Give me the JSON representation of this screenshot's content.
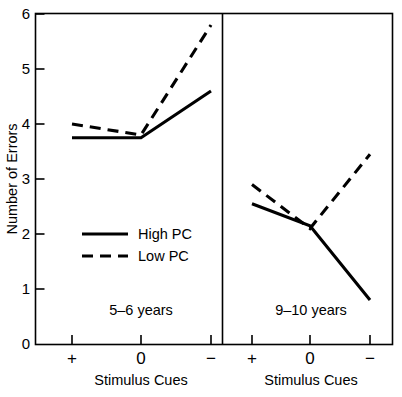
{
  "chart_data": {
    "type": "line",
    "title": "",
    "xlabel": "Stimulus Cues",
    "ylabel": "Number of Errors",
    "ylim": [
      0,
      6
    ],
    "yticks": [
      0,
      1,
      2,
      3,
      4,
      5,
      6
    ],
    "ytick_labels": [
      "0",
      "1",
      "2",
      "3",
      "4",
      "5",
      "6"
    ],
    "categories": [
      "+",
      "0",
      "−"
    ],
    "grid": false,
    "legend_position": "center-left inside left panel",
    "legend": [
      {
        "name": "High PC",
        "style": "solid"
      },
      {
        "name": "Low PC",
        "style": "dashed"
      }
    ],
    "panels": [
      {
        "label": "5–6 years",
        "categories": [
          "+",
          "0",
          "−"
        ],
        "series": [
          {
            "name": "High PC",
            "style": "solid",
            "values": [
              3.75,
              3.75,
              4.6
            ]
          },
          {
            "name": "Low PC",
            "style": "dashed",
            "values": [
              4.0,
              3.8,
              5.8
            ]
          }
        ]
      },
      {
        "label": "9–10 years",
        "categories": [
          "+",
          "0",
          "−"
        ],
        "series": [
          {
            "name": "High PC",
            "style": "solid",
            "values": [
              2.55,
              2.15,
              0.8
            ]
          },
          {
            "name": "Low PC",
            "style": "dashed",
            "values": [
              2.9,
              2.1,
              3.45
            ]
          }
        ]
      }
    ]
  },
  "axis": {
    "y_title": "Number of Errors",
    "x_title_left": "Stimulus Cues",
    "x_title_right": "Stimulus Cues",
    "x_symbols": [
      "+",
      "0",
      "−"
    ],
    "y_tick_labels": [
      "6",
      "5",
      "4",
      "3",
      "2",
      "1",
      "0"
    ]
  },
  "legend": {
    "high_pc": "High PC",
    "low_pc": "Low PC"
  },
  "panels": {
    "left_label": "5–6 years",
    "right_label": "9–10 years"
  },
  "colors": {
    "ink": "#000000",
    "background": "#ffffff"
  }
}
